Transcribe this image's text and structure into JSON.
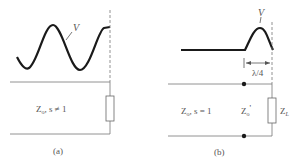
{
  "panel_a": {
    "voltage_label": "V",
    "line_label_main": "Z",
    "line_label_sub": "o",
    "line_label_rest": ", s ≠ 1",
    "caption": "(a)"
  },
  "panel_b": {
    "voltage_label": "V",
    "dimension_label": "λ/4",
    "line_label_main": "Z",
    "line_label_sub": "o",
    "line_label_rest": ", s = 1",
    "transformer_label_main": "Z",
    "transformer_label_sub": "o",
    "transformer_label_prime": "'",
    "load_label_main": "Z",
    "load_label_sub": "L",
    "caption": "(b)"
  },
  "colors": {
    "curve": "#1a1a1a",
    "lines": "#555555",
    "text": "#555555"
  }
}
